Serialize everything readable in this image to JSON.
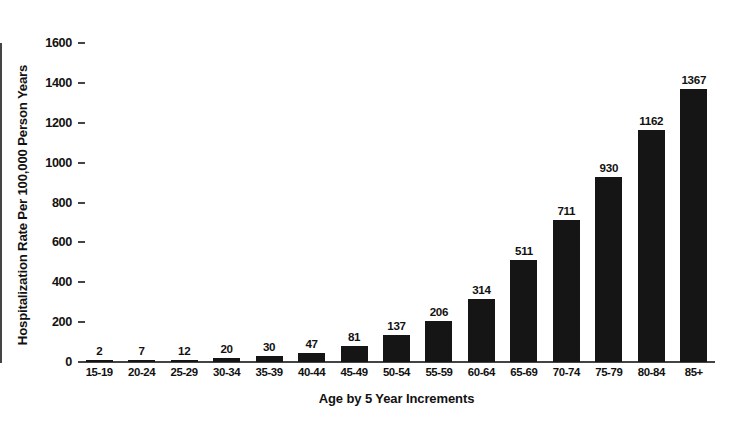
{
  "chart_data": {
    "type": "bar",
    "title": "",
    "xlabel": "Age by 5 Year Increments",
    "ylabel": "Hospitalization Rate Per 100,000 Person Years",
    "categories": [
      "15-19",
      "20-24",
      "25-29",
      "30-34",
      "35-39",
      "40-44",
      "45-49",
      "50-54",
      "55-59",
      "60-64",
      "65-69",
      "70-74",
      "75-79",
      "80-84",
      "85+"
    ],
    "values": [
      2,
      7,
      12,
      20,
      30,
      47,
      81,
      137,
      206,
      314,
      511,
      711,
      930,
      1162,
      1367
    ],
    "value_labels": [
      "2",
      "7",
      "12",
      "20",
      "30",
      "47",
      "81",
      "137",
      "206",
      "314",
      "511",
      "711",
      "930",
      "1162",
      "1367"
    ],
    "ylim": [
      0,
      1600
    ],
    "yticks": [
      0,
      200,
      400,
      600,
      800,
      1000,
      1200,
      1400,
      1600
    ],
    "ytick_labels": [
      "0",
      "200",
      "400",
      "600",
      "800",
      "1000",
      "1200",
      "1400",
      "1600"
    ],
    "grid": false,
    "legend": false,
    "bar_color": "#151515",
    "axis_color": "#444444",
    "background_color": "#ffffff"
  }
}
